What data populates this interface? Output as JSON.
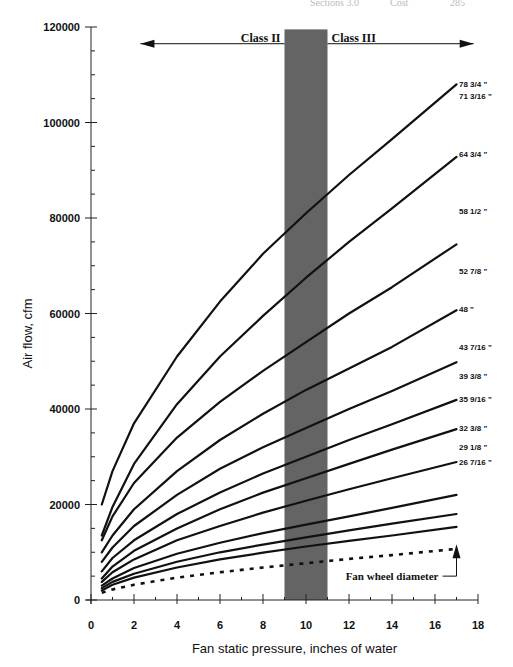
{
  "page_header": {
    "fragment_left": "Sections 3.0",
    "fragment_mid": "Cost",
    "fragment_right": "285"
  },
  "chart_data": {
    "type": "line",
    "title": "",
    "xlabel": "Fan static pressure, inches of water",
    "ylabel": "Air flow, cfm",
    "xlim": [
      0,
      18
    ],
    "ylim": [
      0,
      120000
    ],
    "x_ticks": [
      0,
      2,
      4,
      6,
      8,
      10,
      12,
      14,
      16,
      18
    ],
    "y_ticks": [
      0,
      20000,
      40000,
      60000,
      80000,
      100000,
      120000
    ],
    "x_minor_step": 1,
    "y_minor_step": 5000,
    "grid": false,
    "legend_position": "right-side inline labels",
    "x": [
      0.5,
      1,
      2,
      4,
      6,
      8,
      10,
      12,
      14,
      17
    ],
    "series": [
      {
        "name": "78 3/4 \"",
        "style": "solid",
        "values": [
          20000,
          27000,
          37000,
          51000,
          62500,
          72500,
          81000,
          89000,
          96500,
          108000
        ]
      },
      {
        "name": "71 3/16 \"",
        "style": "solid",
        "values": [
          13500,
          19500,
          28500,
          41000,
          51000,
          59500,
          67500,
          75000,
          82000,
          92800
        ]
      },
      {
        "name": "64 3/4 \"",
        "style": "solid",
        "values": [
          12500,
          17500,
          24500,
          34000,
          41500,
          48000,
          54000,
          60000,
          65500,
          74500
        ]
      },
      {
        "name": "58 1/2 \"",
        "style": "solid",
        "values": [
          10000,
          13500,
          19000,
          27000,
          33500,
          39000,
          44000,
          48500,
          53000,
          60700
        ]
      },
      {
        "name": "52 7/8 \"",
        "style": "solid",
        "values": [
          8000,
          11000,
          15500,
          22000,
          27500,
          32000,
          36000,
          40000,
          43800,
          49800
        ]
      },
      {
        "name": "48 \"",
        "style": "solid",
        "values": [
          6000,
          8800,
          12500,
          18000,
          22500,
          26500,
          30000,
          33500,
          36800,
          41900
        ]
      },
      {
        "name": "43 7/16 \"",
        "style": "solid",
        "values": [
          4500,
          7000,
          10300,
          15000,
          19000,
          22500,
          25500,
          28500,
          31500,
          35800
        ]
      },
      {
        "name": "39 3/8 \"",
        "style": "solid",
        "values": [
          3800,
          5800,
          8500,
          12500,
          15500,
          18300,
          20800,
          23200,
          25500,
          28900
        ]
      },
      {
        "name": "35 9/16 \"",
        "style": "solid",
        "values": [
          3000,
          4500,
          6700,
          9700,
          12000,
          14000,
          15800,
          17500,
          19300,
          22000
        ]
      },
      {
        "name": "32 3/8 \"",
        "style": "solid",
        "values": [
          2500,
          3800,
          5500,
          8000,
          10000,
          11600,
          13100,
          14600,
          16000,
          18000
        ]
      },
      {
        "name": "29 1/8 \"",
        "style": "solid",
        "values": [
          2000,
          3200,
          4700,
          6800,
          8500,
          9900,
          11200,
          12400,
          13500,
          15300
        ]
      },
      {
        "name": "26 7/16 \"",
        "style": "dashed",
        "values": [
          1500,
          2200,
          3200,
          4700,
          5800,
          6800,
          7700,
          8600,
          9400,
          10700
        ]
      }
    ],
    "label_y_positions": [
      108000,
      105500,
      93500,
      81500,
      69000,
      61000,
      53000,
      47000,
      42000,
      36000,
      32000,
      29000
    ],
    "annotations": [
      {
        "text": "Class II",
        "type": "arrow-left",
        "x_from": 9.0,
        "x_to": 2.3,
        "y": 116500
      },
      {
        "text": "Class III",
        "type": "arrow-right",
        "x_from": 11.0,
        "x_to": 17.8,
        "y": 116500
      },
      {
        "text": "Fan wheel diameter",
        "type": "pointer-up",
        "x": 17,
        "y": 5000
      }
    ],
    "shaded_band": {
      "x_from": 9.0,
      "x_to": 11.0,
      "y_from": 0,
      "y_to": 119500,
      "color": "#5c5c5c"
    }
  }
}
